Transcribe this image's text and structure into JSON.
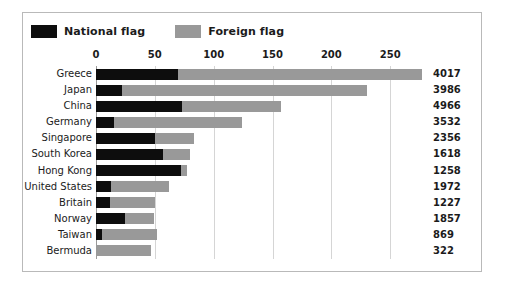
{
  "chart_data": {
    "type": "bar",
    "orientation": "horizontal",
    "stacked": true,
    "title": "",
    "xlabel": "",
    "ylabel": "",
    "xlim": [
      0,
      283
    ],
    "xticks": [
      0,
      50,
      100,
      150,
      200,
      250
    ],
    "grid": true,
    "legend_position": "top-left",
    "categories": [
      "Greece",
      "Japan",
      "China",
      "Germany",
      "Singapore",
      "South Korea",
      "Hong Kong",
      "United States",
      "Britain",
      "Norway",
      "Taiwan",
      "Bermuda"
    ],
    "series": [
      {
        "name": "National flag",
        "color": "#0d0d0d",
        "values": [
          70,
          22,
          73,
          15,
          50,
          57,
          72,
          13,
          12,
          25,
          5,
          0
        ]
      },
      {
        "name": "Foreign flag",
        "color": "#999999",
        "values": [
          207,
          208,
          84,
          109,
          33,
          23,
          5,
          49,
          38,
          24,
          47,
          47
        ]
      }
    ],
    "totals": [
      277,
      230,
      157,
      124,
      83,
      80,
      77,
      62,
      50,
      49,
      52,
      47
    ],
    "value_labels": [
      "4017",
      "3986",
      "4966",
      "3532",
      "2356",
      "1618",
      "1258",
      "1972",
      "1227",
      "1857",
      "869",
      "322"
    ]
  },
  "legend": {
    "items": [
      {
        "label": "National flag",
        "color": "#0d0d0d"
      },
      {
        "label": "Foreign flag",
        "color": "#999999"
      }
    ]
  },
  "style": {
    "border_color": "#b9b9b9",
    "gridline_color": "#d5d5d5",
    "axis_color": "#9a9a9a",
    "text_color": "#1b1b1b"
  }
}
